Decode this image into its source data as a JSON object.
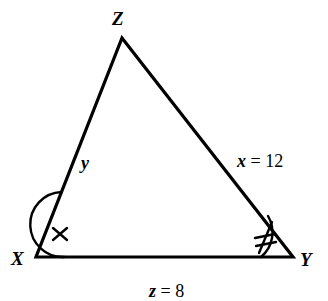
{
  "figure": {
    "type": "triangle-geometry-diagram",
    "background_color": "#ffffff",
    "stroke_color": "#000000",
    "vertices": {
      "z": {
        "label": "Z",
        "x": 122,
        "y": 38
      },
      "x": {
        "label": "X",
        "x": 36,
        "y": 257
      },
      "y": {
        "label": "Y",
        "x": 293,
        "y": 257
      }
    },
    "sides": {
      "xz": {
        "label": "y",
        "variable": "y",
        "relation": "",
        "value": ""
      },
      "zy": {
        "label": "x = 12",
        "variable": "x",
        "relation": "=",
        "value": "12"
      },
      "xy": {
        "label": "z = 8",
        "variable": "z",
        "relation": "=",
        "value": "8"
      }
    },
    "angle_marks": {
      "at_x": {
        "ticks": 1,
        "radius": 28
      },
      "at_y": {
        "ticks": 2,
        "radius": 32
      }
    }
  }
}
